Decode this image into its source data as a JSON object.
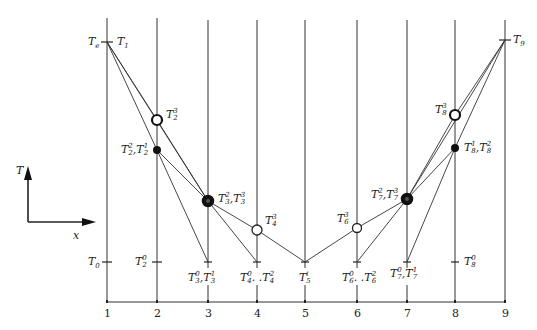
{
  "diagram": {
    "type": "finite-difference temperature iteration diagram",
    "axis_indicator": {
      "vertical_label": "T",
      "horizontal_label": "x"
    },
    "x_ticks": [
      "1",
      "2",
      "3",
      "4",
      "5",
      "6",
      "7",
      "8",
      "9"
    ],
    "left_labels": {
      "top": "T",
      "top_sub": "e",
      "bottom": "T",
      "bottom_sub": "0"
    },
    "labels": [
      {
        "id": "T1",
        "base": "T",
        "sub": "1",
        "sup": ""
      },
      {
        "id": "T9",
        "base": "T",
        "sub": "9",
        "sup": ""
      },
      {
        "id": "T2_3",
        "base": "T",
        "sub": "2",
        "sup": "3"
      },
      {
        "id": "T2_21",
        "text": "T",
        "parts": [
          {
            "sup": "2",
            "sub": "2"
          },
          {
            "sup": "1",
            "sub": "2"
          }
        ]
      },
      {
        "id": "T2_0",
        "base": "T",
        "sub": "2",
        "sup": "0"
      },
      {
        "id": "T3_23",
        "parts": [
          {
            "sup": "2",
            "sub": "3"
          },
          {
            "sup": "3",
            "sub": "3"
          }
        ]
      },
      {
        "id": "T3_01",
        "parts": [
          {
            "sup": "0",
            "sub": "3"
          },
          {
            "sup": "1",
            "sub": "3"
          }
        ]
      },
      {
        "id": "T4_3",
        "base": "T",
        "sub": "4",
        "sup": "3"
      },
      {
        "id": "T4_02",
        "parts": [
          {
            "sup": "0",
            "sub": "4"
          },
          {
            "sup": "2",
            "sub": "4"
          }
        ],
        "sep": ". ."
      },
      {
        "id": "T5_i",
        "base": "T",
        "sub": "5",
        "sup": "i"
      },
      {
        "id": "T6_3",
        "base": "T",
        "sub": "6",
        "sup": "3"
      },
      {
        "id": "T6_02",
        "parts": [
          {
            "sup": "0",
            "sub": "6"
          },
          {
            "sup": "2",
            "sub": "6"
          }
        ],
        "sep": ". ."
      },
      {
        "id": "T7_23",
        "parts": [
          {
            "sup": "2",
            "sub": "7"
          },
          {
            "sup": "3",
            "sub": "7"
          }
        ]
      },
      {
        "id": "T7_01",
        "parts": [
          {
            "sup": "0",
            "sub": "7"
          },
          {
            "sup": "1",
            "sub": "7"
          }
        ]
      },
      {
        "id": "T8_3",
        "base": "T",
        "sub": "8",
        "sup": "3"
      },
      {
        "id": "T8_12",
        "parts": [
          {
            "sup": "1",
            "sub": "8"
          },
          {
            "sup": "2",
            "sub": "8"
          }
        ]
      },
      {
        "id": "T8_0",
        "base": "T",
        "sub": "8",
        "sup": "0"
      }
    ],
    "colors": {
      "line": "#333333",
      "marker": "#111111",
      "background": "#ffffff"
    }
  }
}
